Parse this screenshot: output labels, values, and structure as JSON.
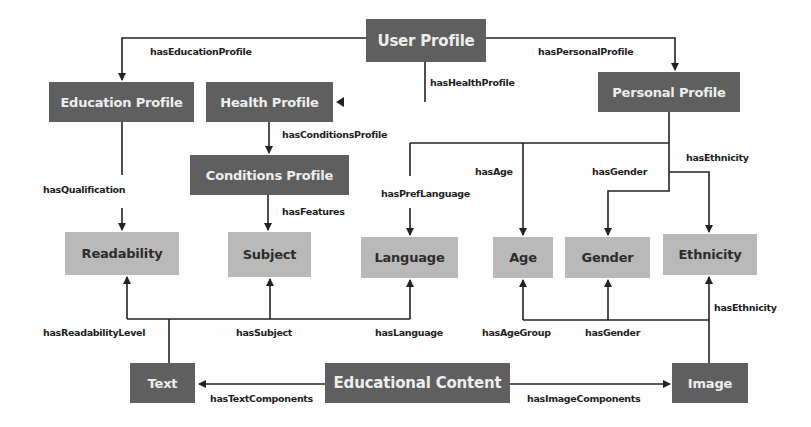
{
  "diagram": {
    "colors": {
      "dark_node": "#5f5f5f",
      "light_node": "#b9b9b9",
      "edge": "#222222",
      "background": "#fdfdfd"
    },
    "nodes": {
      "user_profile": "User Profile",
      "education_profile": "Education Profile",
      "health_profile": "Health Profile",
      "personal_profile": "Personal Profile",
      "conditions_profile": "Conditions Profile",
      "readability": "Readability",
      "subject": "Subject",
      "language": "Language",
      "age": "Age",
      "gender": "Gender",
      "ethnicity": "Ethnicity",
      "text": "Text",
      "educational_content": "Educational Content",
      "image": "Image"
    },
    "edges": {
      "has_education_profile": "hasEducationProfile",
      "has_health_profile": "hasHealthProfile",
      "has_personal_profile": "hasPersonalProfile",
      "has_conditions_profile": "hasConditionsProfile",
      "has_qualification": "hasQualification",
      "has_features": "hasFeatures",
      "has_pref_language": "hasPrefLanguage",
      "has_age": "hasAge",
      "has_gender_top": "hasGender",
      "has_ethnicity_top": "hasEthnicity",
      "has_readability_level": "hasReadabilityLevel",
      "has_subject": "hasSubject",
      "has_language": "hasLanguage",
      "has_age_group": "hasAgeGroup",
      "has_gender_bottom": "hasGender",
      "has_ethnicity_bottom": "hasEthnicity",
      "has_text_components": "hasTextComponents",
      "has_image_components": "hasImageComponents"
    }
  }
}
